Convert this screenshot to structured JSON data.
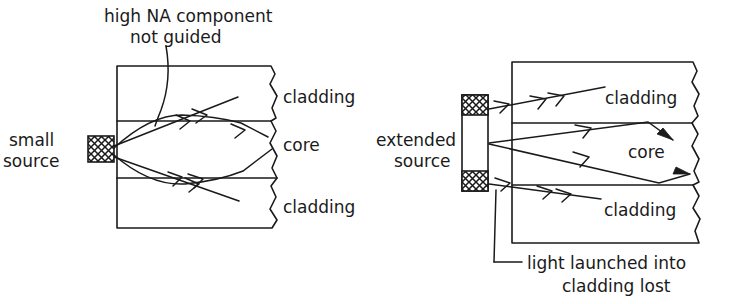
{
  "figure": {
    "background_color": "#ffffff",
    "ink_color": "#1a1a1a"
  },
  "left_diagram": {
    "name": "small-source-launch",
    "annotation": {
      "line1": "high NA component",
      "line2": "not guided"
    },
    "source_label": {
      "line1": "small",
      "line2": "source"
    },
    "layer_labels": {
      "upper_cladding": "cladding",
      "core": "core",
      "lower_cladding": "cladding"
    }
  },
  "right_diagram": {
    "name": "extended-source-launch",
    "source_label": {
      "line1": "extended",
      "line2": "source"
    },
    "layer_labels": {
      "upper_cladding": "cladding",
      "core": "core",
      "lower_cladding": "cladding"
    },
    "annotation": {
      "line1": "light launched into",
      "line2": "cladding lost"
    }
  }
}
